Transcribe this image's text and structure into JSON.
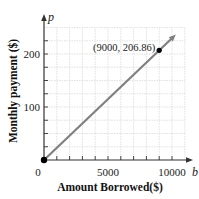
{
  "chart_data": {
    "type": "line",
    "title": "",
    "xlabel": "Amount Borrowed($)",
    "ylabel": "Monthly payment ($)",
    "x_variable": "b",
    "y_variable": "p",
    "xlim": [
      0,
      11000
    ],
    "ylim": [
      0,
      250
    ],
    "x_ticks": [
      0,
      1000,
      2000,
      3000,
      4000,
      5000,
      6000,
      7000,
      8000,
      9000,
      10000
    ],
    "x_tick_labels": [
      "0",
      "5000",
      "10000"
    ],
    "x_tick_label_values": [
      0,
      5000,
      10000
    ],
    "y_ticks": [
      0,
      25,
      50,
      75,
      100,
      125,
      150,
      175,
      200,
      225
    ],
    "y_tick_labels": [
      "100",
      "200"
    ],
    "y_tick_label_values": [
      100,
      200
    ],
    "grid": true,
    "series": [
      {
        "name": "p = 0.022984b",
        "x": [
          0,
          10300
        ],
        "y": [
          0,
          236.7
        ],
        "color": "#808080",
        "arrow_end": true
      }
    ],
    "points": [
      {
        "x": 0,
        "y": 0,
        "label": ""
      },
      {
        "x": 9000,
        "y": 206.86,
        "label": "(9000, 206.86)"
      }
    ],
    "origin_label": "0"
  }
}
